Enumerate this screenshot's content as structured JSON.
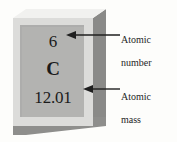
{
  "figure": {
    "type": "periodic-table-element-tile-diagram",
    "background_color": "#fdfdfb"
  },
  "element_tile": {
    "atomic_number": "6",
    "symbol": "C",
    "atomic_mass": "12.01",
    "colors": {
      "frame": "#dcdcda",
      "panel": "#b3b3b1",
      "side_face": "#8a8a88",
      "bottom_face": "#8e8e8c",
      "top_cap": "#f1f1ef",
      "text": "#1b1b1b"
    }
  },
  "callouts": [
    {
      "id": "atomic-number",
      "label": "Atomic\nnumber",
      "line1": "Atomic",
      "line2": "number",
      "points_to": "atomic_number"
    },
    {
      "id": "atomic-mass",
      "label": "Atomic\nmass",
      "line1": "Atomic",
      "line2": "mass",
      "points_to": "atomic_mass"
    }
  ],
  "arrows": {
    "color": "#1f1f1f",
    "direction": "left"
  }
}
